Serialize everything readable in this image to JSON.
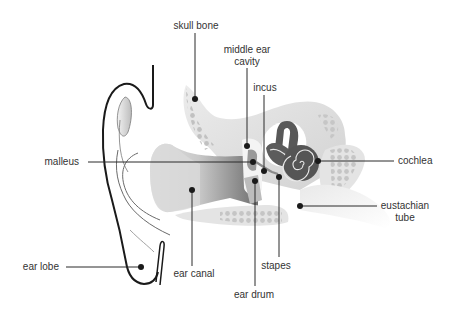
{
  "diagram": {
    "colors": {
      "outline": "#1a1a1a",
      "leader": "#2a2a2a",
      "bone_light": "#e6e6e6",
      "bone_mid": "#cfcfcf",
      "bone_cells": "#b9b9b9",
      "canal_light": "#d8d8d8",
      "canal_dark": "#7a7a7a",
      "inner_ear_dark": "#555555",
      "text": "#333333"
    },
    "labels": [
      {
        "id": "skull-bone",
        "text": "skull bone",
        "x": 196,
        "y": 20,
        "align": "center",
        "dot": [
          195,
          99
        ],
        "leader": [
          [
            195,
            33
          ],
          [
            195,
            99
          ]
        ]
      },
      {
        "id": "middle-ear-cavity",
        "line1": "middle ear",
        "line2": "cavity",
        "x": 247,
        "y": 44,
        "align": "center",
        "dot": [
          247,
          146
        ],
        "leader": [
          [
            247,
            68
          ],
          [
            247,
            146
          ]
        ]
      },
      {
        "id": "incus",
        "text": "incus",
        "x": 265,
        "y": 82,
        "align": "center",
        "dot": [
          264,
          171
        ],
        "leader": [
          [
            264,
            95
          ],
          [
            264,
            171
          ]
        ]
      },
      {
        "id": "malleus",
        "text": "malleus",
        "x": 79,
        "y": 157,
        "align": "right",
        "dot": [
          253,
          162
        ],
        "leader": [
          [
            88,
            162
          ],
          [
            253,
            162
          ]
        ]
      },
      {
        "id": "cochlea",
        "text": "cochlea",
        "x": 398,
        "y": 157,
        "align": "left",
        "dot": [
          318,
          161
        ],
        "leader": [
          [
            318,
            161
          ],
          [
            394,
            161
          ]
        ]
      },
      {
        "id": "eustachian-tube",
        "line1": "eustachian",
        "line2": "tube",
        "x": 404,
        "y": 200,
        "align": "center",
        "dot": [
          300,
          206
        ],
        "leader": [
          [
            300,
            206
          ],
          [
            377,
            206
          ]
        ]
      },
      {
        "id": "ear-canal",
        "text": "ear canal",
        "x": 194,
        "y": 268,
        "align": "center",
        "dot": [
          192,
          190
        ],
        "leader": [
          [
            192,
            190
          ],
          [
            192,
            266
          ]
        ]
      },
      {
        "id": "ear-drum",
        "text": "ear drum",
        "x": 254,
        "y": 289,
        "align": "center",
        "dot": [
          255,
          181
        ],
        "leader": [
          [
            255,
            181
          ],
          [
            255,
            286
          ]
        ]
      },
      {
        "id": "stapes",
        "text": "stapes",
        "x": 276,
        "y": 260,
        "align": "center",
        "dot": [
          279,
          177
        ],
        "leader": [
          [
            279,
            177
          ],
          [
            279,
            257
          ]
        ]
      },
      {
        "id": "ear-lobe",
        "text": "ear lobe",
        "x": 59,
        "y": 262,
        "align": "right",
        "dot": [
          141,
          267
        ],
        "leader": [
          [
            66,
            267
          ],
          [
            141,
            267
          ]
        ]
      }
    ]
  }
}
